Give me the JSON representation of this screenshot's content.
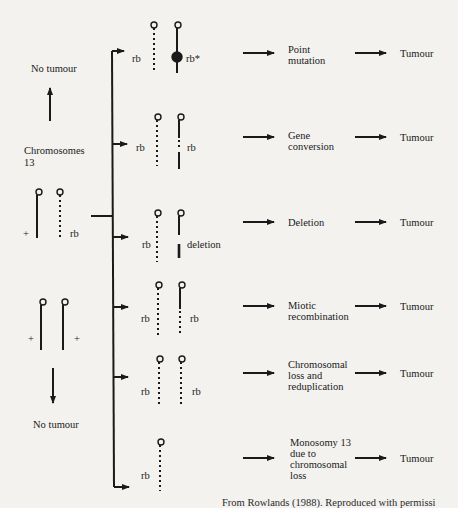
{
  "figure": {
    "left": {
      "top_outcome": "No tumour",
      "chromosome_label_line1": "Chromosomes",
      "chromosome_label_line2": "13",
      "heterozygote": {
        "normal_mark": "+",
        "mutant_label": "rb"
      },
      "normal_pair": {
        "left_mark": "+",
        "right_mark": "+"
      },
      "bottom_outcome": "No tumour"
    },
    "branches": [
      {
        "id": "point-mutation",
        "left_label": "rb",
        "right_label": "rb*",
        "mechanism_lines": [
          "Point",
          "mutation"
        ],
        "outcome": "Tumour"
      },
      {
        "id": "gene-conversion",
        "left_label": "rb",
        "right_label": "rb",
        "mechanism_lines": [
          "Gene",
          "conversion"
        ],
        "outcome": "Tumour"
      },
      {
        "id": "deletion",
        "left_label": "rb",
        "right_label": "deletion",
        "mechanism_lines": [
          "Deletion"
        ],
        "outcome": "Tumour"
      },
      {
        "id": "miotic-recombination",
        "left_label": "rb",
        "right_label": "rb",
        "mechanism_lines": [
          "Miotic",
          "recombination"
        ],
        "outcome": "Tumour"
      },
      {
        "id": "chromosomal-loss-reduplication",
        "left_label": "rb",
        "right_label": "rb",
        "mechanism_lines": [
          "Chromosomal",
          "loss and",
          "reduplication"
        ],
        "outcome": "Tumour"
      },
      {
        "id": "monosomy-13",
        "left_label": "rb",
        "right_label": "",
        "mechanism_lines": [
          "Monosomy 13",
          "due to",
          "chromosomal",
          "loss"
        ],
        "outcome": "Tumour"
      }
    ],
    "caption_partial": "From Rowlands (1988). Reproduced with permissi"
  },
  "colors": {
    "paper": "#f3f2ef",
    "ink": "#1a1a1a"
  }
}
